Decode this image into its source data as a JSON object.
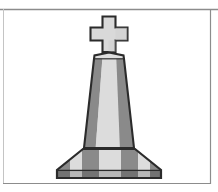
{
  "image": {
    "title": "Memorial Monument with Cross",
    "subject": "monument",
    "style": "grayscale clip art line illustration",
    "alt_text": "Grayscale clip-art of a tall tapered memorial monument topped by a cross, standing on a wide flared striped base",
    "width": 218,
    "height": 192
  },
  "colors": {
    "background": "#ffffff",
    "outline": "#2b2b2b",
    "stone_light": "#d9d9d9",
    "stone_mid": "#c9c9c9",
    "stone_dark": "#8a8a8a",
    "stone_shadow": "#7a7a7a",
    "frame_line": "#8c8c8c"
  },
  "frame": {
    "name": "page-border",
    "top_line_y": 9,
    "right_line_x": 210,
    "bottom_line_y": 184,
    "left_line_x": 3,
    "stroke_width": 1
  },
  "elements": {
    "cross": {
      "label": "Cross finial",
      "center_x": 109,
      "top_y": 16,
      "bottom_y": 52,
      "arm_width": 38,
      "arm_thickness": 13,
      "fill": "#d9d9d9",
      "stroke": "#2b2b2b"
    },
    "column": {
      "label": "Tapered monument shaft",
      "top_y": 55,
      "bottom_y": 148,
      "top_width": 30,
      "bottom_width": 50,
      "cap_peak_height": 4,
      "stripes": [
        {
          "name": "left-dark-stripe",
          "fill": "#8a8a8a"
        },
        {
          "name": "center-light-stripe",
          "fill": "#d9d9d9"
        },
        {
          "name": "right-dark-stripe",
          "fill": "#8a8a8a"
        }
      ]
    },
    "base": {
      "label": "Flared plinth base",
      "top_y": 148,
      "bottom_y": 178,
      "top_width": 52,
      "bottom_width": 104,
      "stripes": [
        {
          "name": "base-stripe-1",
          "fill": "#8a8a8a"
        },
        {
          "name": "base-stripe-2",
          "fill": "#d9d9d9"
        },
        {
          "name": "base-stripe-3",
          "fill": "#8a8a8a"
        },
        {
          "name": "base-stripe-4",
          "fill": "#d9d9d9"
        },
        {
          "name": "base-stripe-5",
          "fill": "#8a8a8a"
        },
        {
          "name": "base-stripe-6",
          "fill": "#d9d9d9"
        },
        {
          "name": "base-stripe-7",
          "fill": "#8a8a8a"
        }
      ]
    }
  }
}
